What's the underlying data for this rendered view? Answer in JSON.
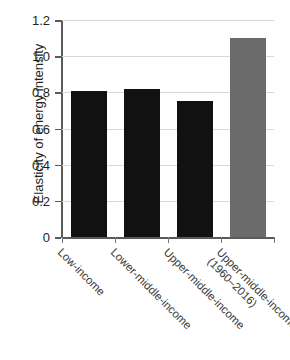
{
  "chart_data": {
    "type": "bar",
    "title": "",
    "xlabel": "",
    "ylabel": "Elasticity of energy intensity",
    "ylim": [
      0,
      1.2
    ],
    "ytick_step": 0.2,
    "grid": true,
    "legend": "none",
    "categories": [
      "Low-income",
      "Lower-middle-income",
      "Upper-middle-income",
      "Upper-middle-income (1960–2016)"
    ],
    "category_lines": [
      [
        "Low-income"
      ],
      [
        "Lower-middle-income"
      ],
      [
        "Upper-middle-income"
      ],
      [
        "Upper-middle-income",
        "(1960–2016)"
      ]
    ],
    "values": [
      0.81,
      0.82,
      0.75,
      1.1
    ],
    "bar_colors": [
      "#111111",
      "#111111",
      "#111111",
      "#6b6b6b"
    ],
    "ytick_labels": [
      "0",
      "0.2",
      "0.4",
      "0.6",
      "0.8",
      "1.0",
      "1.2"
    ],
    "ytick_values": [
      0,
      0.2,
      0.4,
      0.6,
      0.8,
      1.0,
      1.2
    ]
  },
  "colors": {
    "bar_black": "#111111",
    "bar_gray": "#6b6b6b",
    "grid": "#d9d9d9",
    "axis": "#5a5a5a",
    "text": "#231f20",
    "label_text": "#3a3a3a",
    "background": "#ffffff"
  }
}
